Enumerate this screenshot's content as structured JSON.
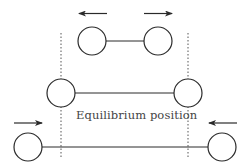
{
  "diagram": {
    "label": "Equilibrium position",
    "colors": {
      "stroke": "#2a2a2a",
      "text": "#444444",
      "dotted": "#555555",
      "background": "#ffffff"
    },
    "states": [
      {
        "name": "stretched-apart",
        "arrows": [
          "left-outward",
          "right-outward"
        ],
        "atom_separation": "short"
      },
      {
        "name": "equilibrium",
        "arrows": [],
        "atom_separation": "equilibrium"
      },
      {
        "name": "compressed-inward",
        "arrows": [
          "right-inward",
          "left-inward"
        ],
        "atom_separation": "long"
      }
    ]
  }
}
